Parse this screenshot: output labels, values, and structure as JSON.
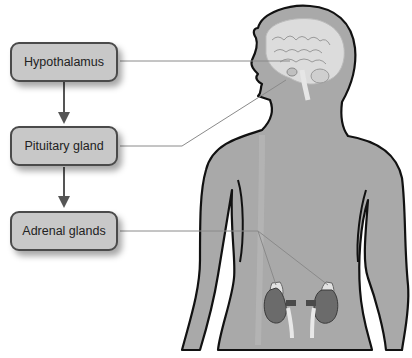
{
  "diagram": {
    "boxes": [
      {
        "id": "hypothalamus",
        "label": "Hypothalamus"
      },
      {
        "id": "pituitary",
        "label": "Pituitary gland"
      },
      {
        "id": "adrenal",
        "label": "Adrenal glands"
      }
    ],
    "arrows": [
      {
        "from": "hypothalamus",
        "to": "pituitary"
      },
      {
        "from": "pituitary",
        "to": "adrenal"
      }
    ],
    "leader_lines": [
      {
        "from": "hypothalamus",
        "target": "brain-hypothalamus"
      },
      {
        "from": "pituitary",
        "target": "brain-pituitary"
      },
      {
        "from": "adrenal",
        "target": "kidney-adrenals"
      }
    ],
    "illustration": {
      "subject": "human-torso-silhouette",
      "features": [
        "brain",
        "left-kidney",
        "right-kidney",
        "adrenal-glands"
      ]
    },
    "colors": {
      "box_fill": "#c8c8c8",
      "box_border": "#4a4a4a",
      "body_fill": "#a9a9a9",
      "body_outline": "#111111",
      "kidney_fill": "#6b6b6b",
      "adrenal_fill": "#e2e2e2",
      "leader_line": "#8a8a8a"
    }
  }
}
